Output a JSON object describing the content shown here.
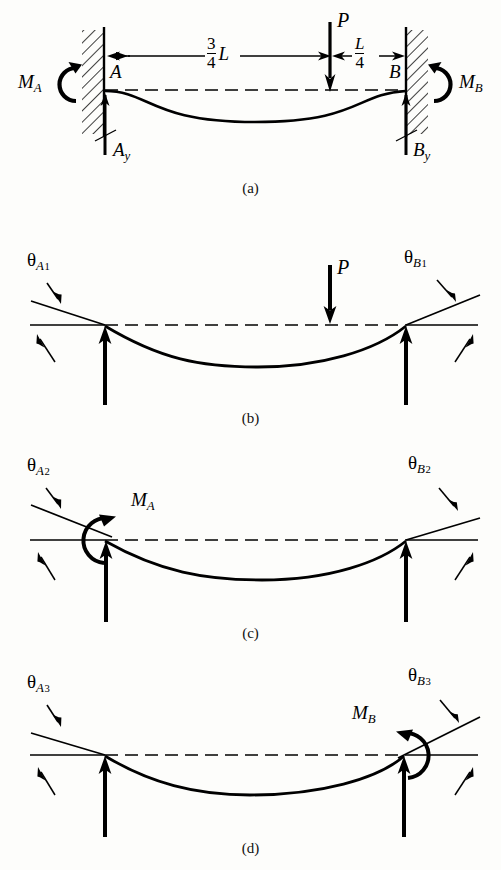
{
  "figure": {
    "line_color": "#000000",
    "background": "#fdfdfb"
  },
  "panels": [
    {
      "id": "a",
      "caption": "(a)",
      "description": "Fixed-fixed beam with concentrated load P",
      "labels": {
        "support_a": "A",
        "support_b": "B",
        "moment_a": "M_A",
        "moment_b": "M_B",
        "reaction_a": "A_y",
        "reaction_b": "B_y",
        "load": "P",
        "dim_left_num": "3",
        "dim_left_den": "4",
        "dim_left_var": "L",
        "dim_right_num": "L",
        "dim_right_den": "4"
      }
    },
    {
      "id": "b",
      "caption": "(b)",
      "description": "Simply supported beam with load P, end rotations",
      "labels": {
        "load": "P",
        "theta_a": "theta_A1",
        "theta_b": "theta_B1"
      }
    },
    {
      "id": "c",
      "caption": "(c)",
      "description": "Simply supported beam with applied end moment M_A",
      "labels": {
        "moment": "M_A",
        "theta_a": "theta_A2",
        "theta_b": "theta_B2"
      }
    },
    {
      "id": "d",
      "caption": "(d)",
      "description": "Simply supported beam with applied end moment M_B",
      "labels": {
        "moment": "M_B",
        "theta_a": "theta_A3",
        "theta_b": "theta_B3"
      }
    }
  ],
  "text": {
    "A": "A",
    "B": "B",
    "M": "M",
    "P": "P",
    "L": "L",
    "three": "3",
    "four": "4",
    "theta": "θ",
    "sub_A": "A",
    "sub_B": "B",
    "sub_y": "y",
    "one": "1",
    "two": "2",
    "three_idx": "3",
    "caption_a": "(a)",
    "caption_b": "(b)",
    "caption_c": "(c)",
    "caption_d": "(d)"
  }
}
